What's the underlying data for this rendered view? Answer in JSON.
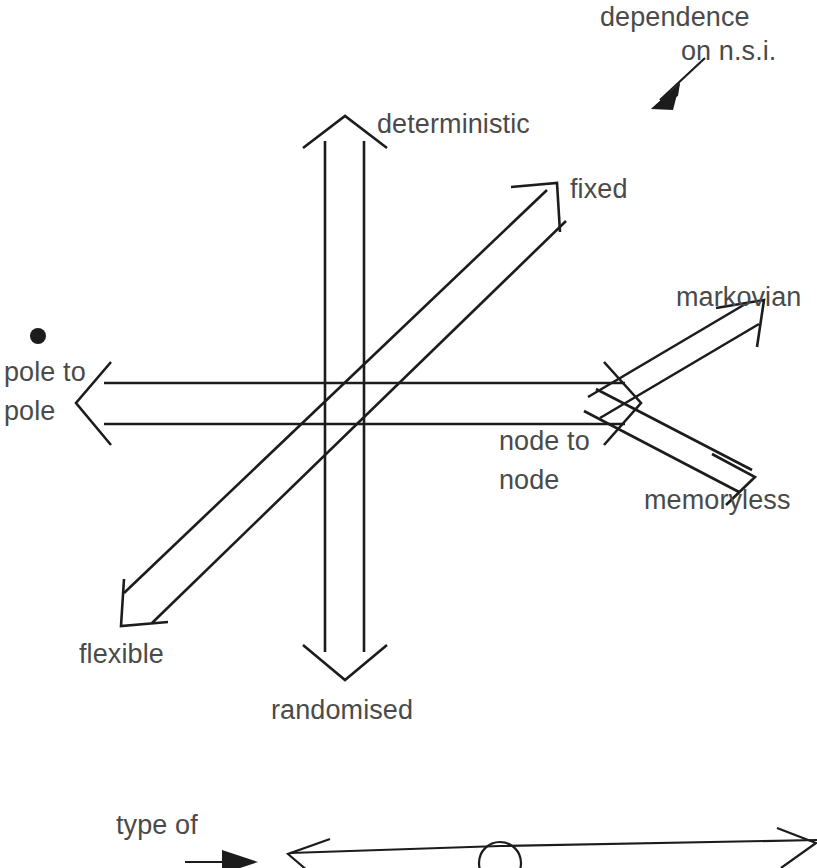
{
  "figure": {
    "kind": "hand-drawn classification axes diagram",
    "background_color": "#ffffff",
    "ink_color": "#1c1c1c",
    "label_color": "#4a4a4a"
  },
  "labels": {
    "dependence_line1": "dependence",
    "dependence_line2": "on n.s.i.",
    "deterministic": "deterministic",
    "fixed": "fixed",
    "markovian": "markovian",
    "pole_to_line1": "pole to",
    "pole_to_line2": "pole",
    "node_to_line1": "node to",
    "node_to_line2": "node",
    "memoryless": "memoryless",
    "flexible": "flexible",
    "randomised": "randomised",
    "type_of": "type of"
  },
  "axes": [
    {
      "name": "vertical-axis",
      "positive_label": "deterministic",
      "negative_label": "randomised",
      "style": "outline-band-double-headed"
    },
    {
      "name": "horizontal-axis",
      "positive_label": "node to node",
      "negative_label": "pole to pole",
      "style": "outline-band-double-headed"
    },
    {
      "name": "diagonal-axis",
      "positive_label": "fixed",
      "negative_label": "flexible",
      "style": "outline-band-double-headed"
    },
    {
      "name": "branch-axis-markovian",
      "positive_label": "markovian",
      "style": "outline-band-single-headed"
    },
    {
      "name": "branch-axis-memoryless",
      "positive_label": "memoryless",
      "style": "outline-band-single-headed"
    }
  ],
  "annotations": {
    "pointer_arrow_name": "dependence-pointer-arrow",
    "bullet_marker_name": "pole-to-pole-bullet",
    "bottom_scale_name": "type-of-flow-scale"
  }
}
